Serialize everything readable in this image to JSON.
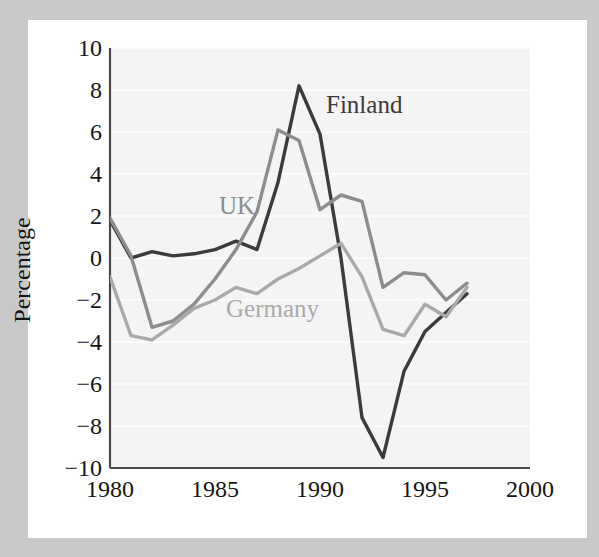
{
  "figure": {
    "background_color": "#c9c9c9",
    "paper_color": "#ffffff",
    "panel_color": "#f4f4f4"
  },
  "axes": {
    "y_label": "Percentage",
    "y_ticks": [
      "10",
      "8",
      "6",
      "4",
      "2",
      "0",
      "-2",
      "-4",
      "-6",
      "-8",
      "-10"
    ],
    "x_ticks": [
      "1980",
      "1985",
      "1990",
      "1995",
      "2000"
    ]
  },
  "annotations": {
    "finland": "Finland",
    "uk": "UK",
    "germany": "Germany"
  },
  "chart_data": {
    "type": "line",
    "title": "",
    "xlabel": "",
    "ylabel": "Percentage",
    "xlim": [
      1980,
      2000
    ],
    "ylim": [
      -10,
      10
    ],
    "x_ticks": [
      1980,
      1985,
      1990,
      1995,
      2000
    ],
    "y_ticks": [
      -10,
      -8,
      -6,
      -4,
      -2,
      0,
      2,
      4,
      6,
      8,
      10
    ],
    "grid": "horizontal-faint",
    "legend": "inline-annotations",
    "x": [
      1980,
      1981,
      1982,
      1983,
      1984,
      1985,
      1986,
      1987,
      1988,
      1989,
      1990,
      1991,
      1992,
      1993,
      1994,
      1995,
      1996,
      1997
    ],
    "series": [
      {
        "name": "Finland",
        "color": "#3b3b3b",
        "values": [
          1.8,
          0.0,
          0.3,
          0.1,
          0.2,
          0.4,
          0.8,
          0.4,
          3.6,
          8.2,
          5.9,
          0.0,
          -7.6,
          -9.5,
          -5.4,
          -3.5,
          -2.6,
          -1.7
        ]
      },
      {
        "name": "UK",
        "color": "#8d8d8d",
        "values": [
          1.9,
          0.1,
          -3.3,
          -3.0,
          -2.2,
          -1.0,
          0.4,
          2.2,
          6.1,
          5.6,
          2.3,
          3.0,
          2.7,
          -1.4,
          -0.7,
          -0.8,
          -2.0,
          -1.2
        ]
      },
      {
        "name": "Germany",
        "color": "#a9a9a9",
        "values": [
          -0.9,
          -3.7,
          -3.9,
          -3.2,
          -2.4,
          -2.0,
          -1.4,
          -1.7,
          -1.0,
          -0.5,
          0.1,
          0.7,
          -0.9,
          -3.4,
          -3.7,
          -2.2,
          -2.8,
          -1.4
        ]
      }
    ]
  }
}
